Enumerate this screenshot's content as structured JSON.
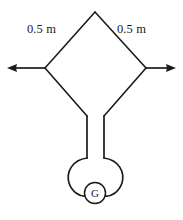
{
  "figure": {
    "background_color": "#ffffff",
    "stroke_color": "#1c1c1c",
    "labels": {
      "left_side": "0.5 m",
      "right_side": "0.5 m",
      "gravity_marker": "G"
    },
    "geometry": {
      "apex": {
        "x": 95,
        "y": 12
      },
      "left_vertex": {
        "x": 45,
        "y": 68
      },
      "right_vertex": {
        "x": 146,
        "y": 68
      },
      "left_knee": {
        "x": 87,
        "y": 116
      },
      "right_knee": {
        "x": 104,
        "y": 116
      },
      "tube_left_x": 87,
      "tube_right_x": 104,
      "tube_bottom_y": 160,
      "loop_center": {
        "x": 95,
        "y": 177
      },
      "loop_radius_x": 26,
      "loop_radius_y": 23,
      "g_circle_center": {
        "x": 95,
        "y": 193
      },
      "g_circle_radius": 10.5,
      "left_arrow_tip": {
        "x": 7,
        "y": 68
      },
      "right_arrow_tip": {
        "x": 176,
        "y": 68
      }
    }
  }
}
